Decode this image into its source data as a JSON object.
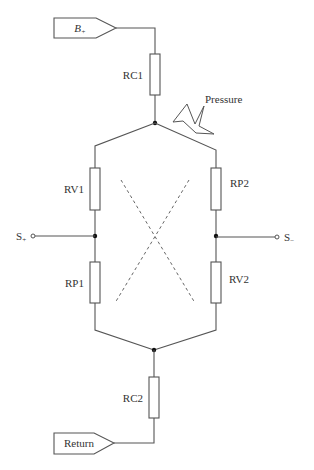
{
  "diagram": {
    "type": "circuit-schematic",
    "supply_tag": {
      "label": "B",
      "subscript": "+"
    },
    "return_tag": {
      "label": "Return"
    },
    "pressure_label": "Pressure",
    "resistors": [
      {
        "id": "RC1",
        "label": "RC1",
        "position": "top"
      },
      {
        "id": "RV1",
        "label": "RV1",
        "position": "left-upper"
      },
      {
        "id": "RP1",
        "label": "RP1",
        "position": "left-lower"
      },
      {
        "id": "RP2",
        "label": "RP2",
        "position": "right-upper"
      },
      {
        "id": "RV2",
        "label": "RV2",
        "position": "right-lower"
      },
      {
        "id": "RC2",
        "label": "RC2",
        "position": "bottom"
      }
    ],
    "terminals": [
      {
        "id": "s_plus",
        "label": "S",
        "subscript": "+"
      },
      {
        "id": "s_minus",
        "label": "S",
        "subscript": "−"
      }
    ],
    "colors": {
      "line": "#555555",
      "node": "#111111",
      "text": "#333333",
      "background": "#ffffff"
    }
  }
}
